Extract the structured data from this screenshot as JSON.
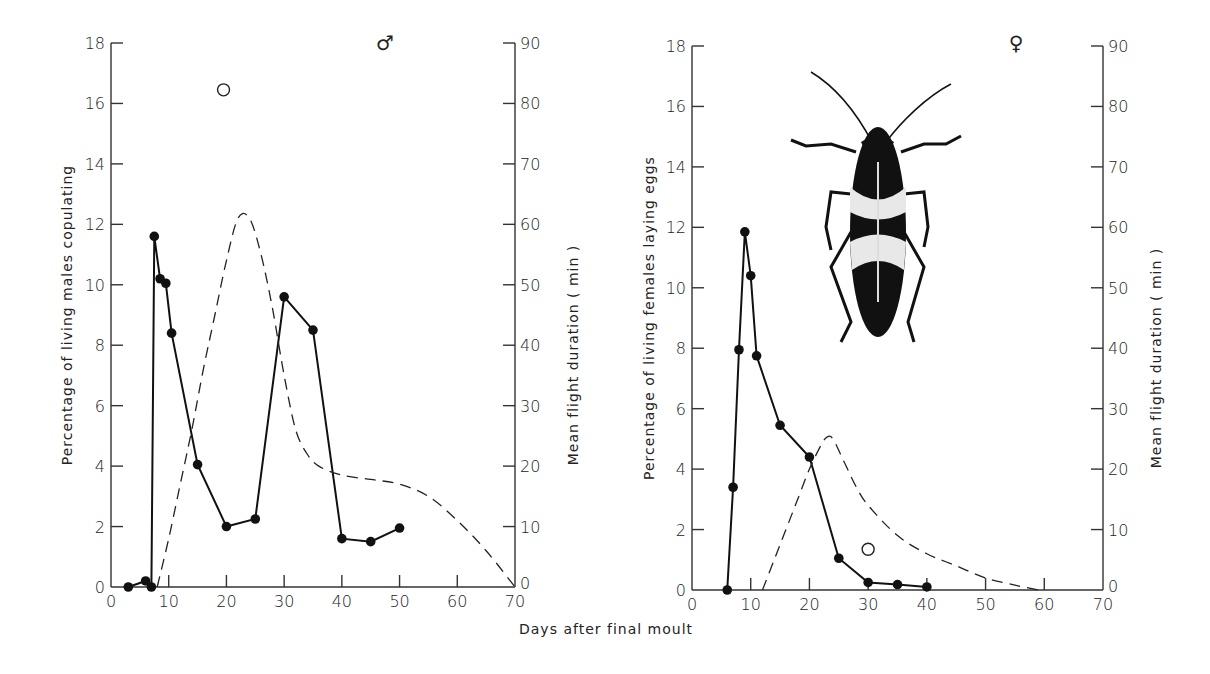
{
  "figure": {
    "xlabel": "Days after final moult"
  },
  "chart_data": [
    {
      "type": "line",
      "panel": "left",
      "sex_symbol": "♂",
      "title": "",
      "xlabel": "Days after final moult",
      "ylabel": "Percentage of living males copulating",
      "y2label": "Mean flight duration ( min )",
      "xlim": [
        0,
        70
      ],
      "ylim": [
        0,
        18
      ],
      "y2lim": [
        0,
        90
      ],
      "xticks": [
        0,
        10,
        20,
        30,
        40,
        50,
        60,
        70
      ],
      "yticks": [
        0,
        2,
        4,
        6,
        8,
        10,
        12,
        14,
        16,
        18
      ],
      "y2ticks": [
        0,
        10,
        20,
        30,
        40,
        50,
        60,
        70,
        80,
        90
      ],
      "grid": false,
      "series": [
        {
          "name": "Males copulating (%)",
          "style": "solid line with filled circles",
          "axis": "left",
          "x": [
            3,
            6,
            7,
            7.5,
            8.5,
            9.5,
            10.5,
            15,
            20,
            25,
            30,
            35,
            40,
            45,
            50
          ],
          "y": [
            0,
            0.2,
            0,
            11.6,
            10.2,
            10.05,
            8.4,
            4.05,
            2.0,
            2.25,
            9.6,
            8.5,
            1.6,
            1.5,
            1.95
          ]
        },
        {
          "name": "Mean flight duration (min)",
          "style": "dashed curve",
          "axis": "right",
          "x": [
            8,
            10,
            12,
            14,
            16,
            18,
            20,
            22,
            24,
            26,
            28,
            30,
            32,
            34,
            36,
            40,
            45,
            50,
            55,
            60,
            65,
            70
          ],
          "y": [
            0,
            8,
            17,
            26,
            36,
            45,
            54,
            61,
            61,
            55,
            46,
            35,
            26,
            22,
            20,
            18.5,
            17.8,
            17,
            15,
            11,
            6,
            0
          ]
        },
        {
          "name": "Isolated open circle",
          "style": "open circle",
          "axis": "left",
          "x": [
            19.5
          ],
          "y": [
            16.45
          ]
        }
      ]
    },
    {
      "type": "line",
      "panel": "right",
      "sex_symbol": "♀",
      "title": "",
      "xlabel": "Days after final moult",
      "ylabel": "Percentage of living females laying eggs",
      "y2label": "Mean flight duration ( min )",
      "xlim": [
        0,
        70
      ],
      "ylim": [
        0,
        18
      ],
      "y2lim": [
        0,
        90
      ],
      "xticks": [
        0,
        10,
        20,
        30,
        40,
        50,
        60,
        70
      ],
      "yticks": [
        0,
        2,
        4,
        6,
        8,
        10,
        12,
        14,
        16,
        18
      ],
      "y2ticks": [
        0,
        10,
        20,
        30,
        40,
        50,
        60,
        70,
        80,
        90
      ],
      "grid": false,
      "series": [
        {
          "name": "Females laying eggs (%)",
          "style": "solid line with filled circles",
          "axis": "left",
          "x": [
            6,
            7,
            8,
            9,
            10,
            11,
            15,
            20,
            25,
            30,
            35,
            40
          ],
          "y": [
            0,
            3.4,
            7.95,
            11.85,
            10.4,
            7.75,
            5.45,
            4.4,
            1.05,
            0.25,
            0.18,
            0.1
          ]
        },
        {
          "name": "Mean flight duration (min)",
          "style": "dashed curve",
          "axis": "right",
          "x": [
            12,
            14,
            16,
            18,
            20,
            22,
            23,
            24,
            26,
            28,
            30,
            35,
            40,
            45,
            50,
            55,
            59
          ],
          "y": [
            0,
            5,
            10,
            15,
            20,
            24,
            25.3,
            25,
            21,
            17,
            14,
            9,
            6,
            4,
            2,
            0.8,
            0
          ]
        },
        {
          "name": "Isolated open circle",
          "style": "open circle",
          "axis": "left",
          "x": [
            30
          ],
          "y": [
            1.35
          ]
        }
      ],
      "illustration": "insect (mirid bug) dorsal view"
    }
  ]
}
